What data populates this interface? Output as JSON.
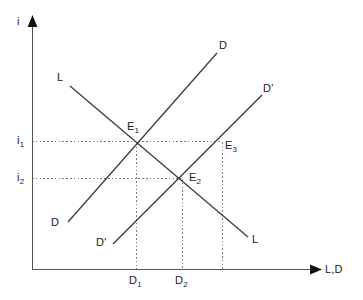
{
  "figure": {
    "type": "line-diagram",
    "title": "",
    "background_color": "#ffffff",
    "line_color": "#3a3a3a",
    "axis_color": "#555555",
    "dotted_color": "#7a7a7a"
  },
  "axes": {
    "y_label": "i",
    "x_label": "L,D",
    "origin": {
      "x": 32,
      "y": 270
    },
    "y_top": {
      "x": 32,
      "y": 18
    },
    "x_right": {
      "x": 322,
      "y": 270
    },
    "y_ticks": [
      {
        "label": "i",
        "sub": "1",
        "y": 141
      },
      {
        "label": "i",
        "sub": "2",
        "y": 178
      }
    ],
    "x_ticks": [
      {
        "label": "D",
        "sub": "1",
        "x": 136
      },
      {
        "label": "D",
        "sub": "2",
        "x": 182
      }
    ]
  },
  "curves": [
    {
      "name": "L",
      "label_start": "L",
      "label_end": "L",
      "description": "downward-sloping supply of loanable funds",
      "start": {
        "x": 70,
        "y": 86
      },
      "end": {
        "x": 248,
        "y": 237
      }
    },
    {
      "name": "D",
      "label_start": "D",
      "label_end": "D",
      "description": "upward-sloping original demand curve",
      "start": {
        "x": 68,
        "y": 222
      },
      "end": {
        "x": 217,
        "y": 53
      }
    },
    {
      "name": "D'",
      "label_start": "D'",
      "label_end": "D'",
      "description": "upward-sloping shifted demand curve",
      "start": {
        "x": 113,
        "y": 244
      },
      "end": {
        "x": 262,
        "y": 95
      }
    }
  ],
  "points": [
    {
      "label": "E",
      "sub": "1",
      "x": 136,
      "y": 143
    },
    {
      "label": "E",
      "sub": "2",
      "x": 181,
      "y": 179
    },
    {
      "label": "E",
      "sub": "3",
      "x": 222,
      "y": 142
    }
  ],
  "guides": {
    "horizontal": [
      {
        "from_x": 32,
        "to_x": 222,
        "y": 141,
        "name": "i1-guide"
      },
      {
        "from_x": 32,
        "to_x": 181,
        "y": 178,
        "name": "i2-guide"
      }
    ],
    "vertical": [
      {
        "x": 136,
        "from_y": 143,
        "to_y": 270,
        "name": "d1-guide"
      },
      {
        "x": 182,
        "from_y": 179,
        "to_y": 270,
        "name": "d2-guide"
      },
      {
        "x": 222,
        "from_y": 142,
        "to_y": 270,
        "name": "e3-guide"
      }
    ]
  }
}
